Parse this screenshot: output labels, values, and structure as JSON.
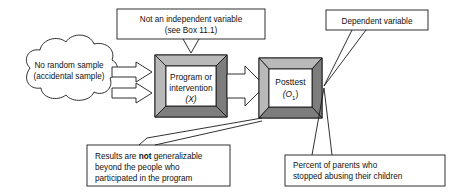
{
  "diagram": {
    "cloud": {
      "name": "sample-cloud",
      "line1": "No random sample",
      "line2": "(accidental sample)"
    },
    "nodes": [
      {
        "id": "program",
        "name": "program-box",
        "line1": "Program or",
        "line2": "intervention",
        "symbol": "(X)",
        "symbol_italic_part": "X"
      },
      {
        "id": "posttest",
        "name": "posttest-box",
        "line1": "Posttest",
        "symbol": "(O",
        "symbol_sub": "1",
        "symbol_close": ")",
        "symbol_italic_part": "O"
      }
    ],
    "callouts": [
      {
        "id": "independent-variable",
        "name": "callout-not-independent-variable",
        "align": "center",
        "lines": [
          "Not an independent variable",
          "(see Box 11.1)"
        ]
      },
      {
        "id": "dependent-variable",
        "name": "callout-dependent-variable",
        "align": "center",
        "lines": [
          "Dependent variable"
        ]
      },
      {
        "id": "generalizability",
        "name": "callout-not-generalizable",
        "align": "left",
        "lines_rich": [
          [
            {
              "t": "Results are ",
              "b": false
            },
            {
              "t": "not",
              "b": true
            },
            {
              "t": " generalizable",
              "b": false
            }
          ],
          [
            {
              "t": "beyond the people who",
              "b": false
            }
          ],
          [
            {
              "t": "participated in the program",
              "b": false
            }
          ]
        ]
      },
      {
        "id": "outcome-measure",
        "name": "callout-percent-parents",
        "align": "left",
        "lines": [
          "Percent of parents who",
          "stopped abusing their children"
        ]
      }
    ],
    "colors": {
      "stroke": "#1a1a1a",
      "bevel_light": "#b9b9b9",
      "bevel_dark": "#7d7d7d",
      "fill": "#ffffff",
      "background": "#ffffff"
    }
  }
}
